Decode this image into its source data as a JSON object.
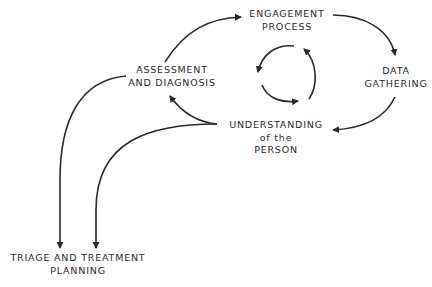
{
  "nodes": {
    "engagement": {
      "line1": "ENGAGEMENT",
      "line2": "PROCESS"
    },
    "data_gathering": {
      "line1": "DATA",
      "line2": "GATHERING"
    },
    "understanding": {
      "line1": "UNDERSTANDING",
      "line2": "of the",
      "line3": "PERSON"
    },
    "assessment": {
      "line1": "ASSESSMENT",
      "line2": "AND DIAGNOSIS"
    },
    "triage": {
      "line1": "TRIAGE AND TREATMENT",
      "line2": "PLANNING"
    }
  },
  "edges": [
    {
      "from": "ASSESSMENT AND DIAGNOSIS",
      "to": "ENGAGEMENT PROCESS"
    },
    {
      "from": "ENGAGEMENT PROCESS",
      "to": "DATA GATHERING"
    },
    {
      "from": "DATA GATHERING",
      "to": "UNDERSTANDING of the PERSON"
    },
    {
      "from": "UNDERSTANDING of the PERSON",
      "to": "ASSESSMENT AND DIAGNOSIS"
    },
    {
      "from": "ASSESSMENT AND DIAGNOSIS",
      "to": "TRIAGE AND TREATMENT PLANNING"
    },
    {
      "from": "UNDERSTANDING of the PERSON",
      "to": "TRIAGE AND TREATMENT PLANNING"
    }
  ],
  "center_symbol": "cycle-arrows",
  "colors": {
    "ink": "#2a2a2a",
    "background": "#ffffff"
  }
}
